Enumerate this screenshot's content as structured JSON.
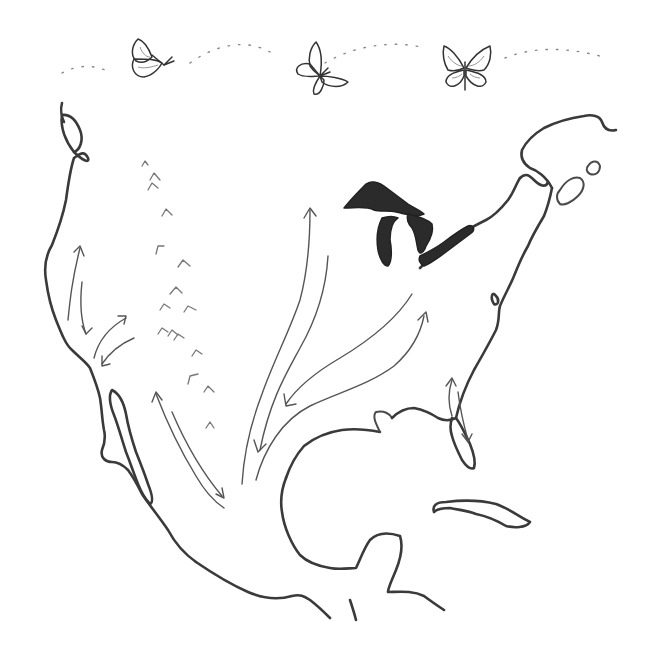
{
  "illustration": {
    "title": "Monarch butterfly migration across North America",
    "style": "pencil sketch",
    "stroke_color": "#3a3a3a",
    "lake_fill": "#2b2b2b",
    "background": "#ffffff",
    "butterflies": [
      {
        "name": "butterfly-side-view",
        "pose": "side"
      },
      {
        "name": "butterfly-three-quarter",
        "pose": "three-quarter"
      },
      {
        "name": "butterfly-front-view",
        "pose": "open-wings"
      }
    ],
    "flight_path": "dotted-line",
    "regions": [
      "west-coast",
      "baja-california",
      "mexico",
      "gulf-coast",
      "florida",
      "east-coast",
      "great-lakes",
      "maritimes",
      "cuba"
    ],
    "migration_arrows": [
      {
        "name": "pacific-coast-south",
        "direction": "south"
      },
      {
        "name": "pacific-coast-north",
        "direction": "north"
      },
      {
        "name": "california-inland-loop",
        "direction": "both"
      },
      {
        "name": "western-mexico-route",
        "direction": "both"
      },
      {
        "name": "central-flyway-north",
        "direction": "north"
      },
      {
        "name": "central-flyway-south",
        "direction": "south"
      },
      {
        "name": "eastern-route-north",
        "direction": "north"
      },
      {
        "name": "eastern-route-south",
        "direction": "south"
      },
      {
        "name": "florida-route",
        "direction": "both"
      }
    ],
    "rocky-mountain-marks": 16
  }
}
